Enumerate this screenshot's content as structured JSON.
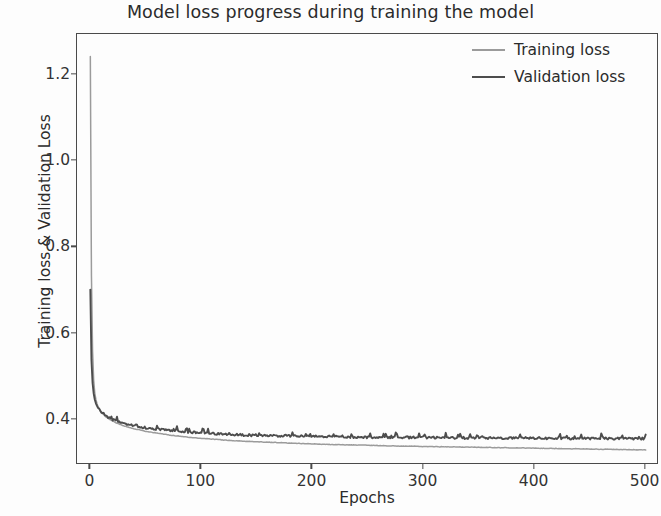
{
  "chart_data": {
    "type": "line",
    "title": "Model loss progress during training the model",
    "xlabel": "Epochs",
    "ylabel": "Training loss & Validation Loss",
    "xlim": [
      -12,
      512
    ],
    "ylim": [
      0.295,
      1.295
    ],
    "xticks": [
      0,
      100,
      200,
      300,
      400,
      500
    ],
    "xtick_labels": [
      "0",
      "100",
      "200",
      "300",
      "400",
      "500"
    ],
    "yticks": [
      0.4,
      0.6,
      0.8,
      1.0,
      1.2
    ],
    "ytick_labels": [
      "0.4",
      "0.6",
      "0.8",
      "1.0",
      "1.2"
    ],
    "grid": false,
    "legend_position": "upper right",
    "series": [
      {
        "name": "Training loss",
        "color": "#9b9b9b",
        "x": [
          0,
          1,
          2,
          3,
          4,
          5,
          6,
          7,
          8,
          9,
          10,
          12,
          14,
          16,
          18,
          20,
          25,
          30,
          35,
          40,
          45,
          50,
          60,
          70,
          80,
          90,
          100,
          120,
          140,
          160,
          180,
          200,
          225,
          250,
          275,
          300,
          325,
          350,
          375,
          400,
          425,
          450,
          475,
          500
        ],
        "values": [
          1.243,
          0.735,
          0.561,
          0.492,
          0.462,
          0.447,
          0.437,
          0.43,
          0.425,
          0.421,
          0.418,
          0.412,
          0.407,
          0.403,
          0.4,
          0.397,
          0.391,
          0.386,
          0.382,
          0.379,
          0.376,
          0.373,
          0.369,
          0.365,
          0.362,
          0.359,
          0.357,
          0.353,
          0.35,
          0.348,
          0.346,
          0.344,
          0.342,
          0.341,
          0.339,
          0.338,
          0.337,
          0.336,
          0.335,
          0.334,
          0.333,
          0.332,
          0.331,
          0.33
        ]
      },
      {
        "name": "Validation loss",
        "color": "#4d4d4d",
        "x": [
          0,
          1,
          2,
          3,
          4,
          5,
          6,
          7,
          8,
          9,
          10,
          12,
          14,
          16,
          18,
          20,
          25,
          30,
          35,
          40,
          45,
          50,
          60,
          70,
          80,
          90,
          100,
          120,
          140,
          160,
          180,
          200,
          225,
          250,
          275,
          300,
          325,
          350,
          375,
          400,
          425,
          450,
          475,
          500
        ],
        "values": [
          0.702,
          0.54,
          0.486,
          0.461,
          0.447,
          0.438,
          0.432,
          0.427,
          0.423,
          0.42,
          0.417,
          0.412,
          0.408,
          0.405,
          0.402,
          0.4,
          0.395,
          0.391,
          0.388,
          0.385,
          0.383,
          0.381,
          0.378,
          0.375,
          0.373,
          0.371,
          0.369,
          0.366,
          0.364,
          0.363,
          0.362,
          0.361,
          0.36,
          0.359,
          0.359,
          0.358,
          0.358,
          0.357,
          0.357,
          0.357,
          0.356,
          0.356,
          0.356,
          0.356
        ]
      }
    ],
    "legend": [
      {
        "label": "Training loss",
        "color": "#9b9b9b"
      },
      {
        "label": "Validation loss",
        "color": "#4d4d4d"
      }
    ]
  }
}
